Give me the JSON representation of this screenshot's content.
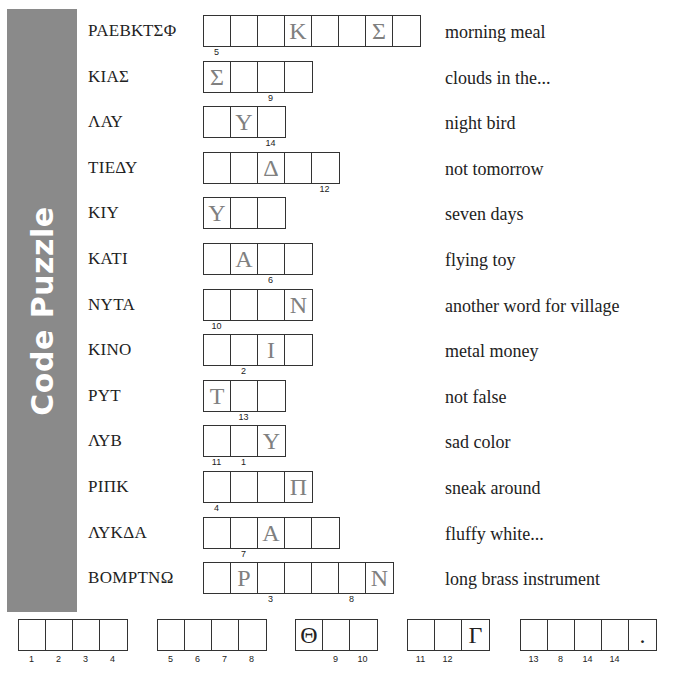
{
  "title": "Code Puzzle",
  "colors": {
    "sidebar": "#8a8a8a",
    "hint_letter": "#808080",
    "text": "#222222"
  },
  "rows": [
    {
      "code": "ΡΑΕΒΚΤΣΦ",
      "cells": [
        "",
        "",
        "",
        "Κ",
        "",
        "",
        "Σ",
        ""
      ],
      "numbers": [
        {
          "pos": 0,
          "n": "5"
        }
      ],
      "clue": "morning meal"
    },
    {
      "code": "ΚΙΑΣ",
      "cells": [
        "Σ",
        "",
        "",
        ""
      ],
      "numbers": [
        {
          "pos": 2,
          "n": "9"
        }
      ],
      "clue": "clouds in the..."
    },
    {
      "code": "ΛΑΥ",
      "cells": [
        "",
        "Υ",
        ""
      ],
      "numbers": [
        {
          "pos": 2,
          "n": "14"
        }
      ],
      "clue": "night bird"
    },
    {
      "code": "ΤΙΕΔΥ",
      "cells": [
        "",
        "",
        "Δ",
        "",
        ""
      ],
      "numbers": [
        {
          "pos": 4,
          "n": "12"
        }
      ],
      "clue": "not tomorrow"
    },
    {
      "code": "ΚΙΥ",
      "cells": [
        "Υ",
        "",
        ""
      ],
      "numbers": [],
      "clue": "seven days"
    },
    {
      "code": "ΚΑΤΙ",
      "cells": [
        "",
        "Α",
        "",
        ""
      ],
      "numbers": [
        {
          "pos": 2,
          "n": "6"
        }
      ],
      "clue": "flying toy"
    },
    {
      "code": "ΝΥΤΑ",
      "cells": [
        "",
        "",
        "",
        "Ν"
      ],
      "numbers": [
        {
          "pos": 0,
          "n": "10"
        }
      ],
      "clue": "another word for village"
    },
    {
      "code": "ΚΙΝΟ",
      "cells": [
        "",
        "",
        "Ι",
        ""
      ],
      "numbers": [
        {
          "pos": 1,
          "n": "2"
        }
      ],
      "clue": "metal money"
    },
    {
      "code": "ΡΥΤ",
      "cells": [
        "Τ",
        "",
        ""
      ],
      "numbers": [
        {
          "pos": 1,
          "n": "13"
        }
      ],
      "clue": "not false"
    },
    {
      "code": "ΛΥΒ",
      "cells": [
        "",
        "",
        "Υ"
      ],
      "numbers": [
        {
          "pos": 0,
          "n": "11"
        },
        {
          "pos": 1,
          "n": "1"
        }
      ],
      "clue": "sad color"
    },
    {
      "code": "ΡΙΠΚ",
      "cells": [
        "",
        "",
        "",
        "Π"
      ],
      "numbers": [
        {
          "pos": 0,
          "n": "4"
        }
      ],
      "clue": "sneak around"
    },
    {
      "code": "ΛΥΚΔΑ",
      "cells": [
        "",
        "",
        "Α",
        "",
        ""
      ],
      "numbers": [
        {
          "pos": 1,
          "n": "7"
        }
      ],
      "clue": "fluffy white..."
    },
    {
      "code": "ΒΟΜΡΤΝΩ",
      "cells": [
        "",
        "Ρ",
        "",
        "",
        "",
        "",
        "Ν"
      ],
      "numbers": [
        {
          "pos": 2,
          "n": "3"
        },
        {
          "pos": 5,
          "n": "8"
        }
      ],
      "clue": "long brass instrument"
    }
  ],
  "answer": [
    {
      "left": 18,
      "cells": [
        "",
        "",
        "",
        ""
      ],
      "numbers": [
        "1",
        "2",
        "3",
        "4"
      ]
    },
    {
      "left": 157,
      "cells": [
        "",
        "",
        "",
        ""
      ],
      "numbers": [
        "5",
        "6",
        "7",
        "8"
      ]
    },
    {
      "left": 295,
      "cells": [
        "Θ",
        "",
        ""
      ],
      "numbers": [
        "",
        "9",
        "10"
      ]
    },
    {
      "left": 407,
      "cells": [
        "",
        "",
        "Γ"
      ],
      "numbers": [
        "11",
        "12",
        ""
      ]
    },
    {
      "left": 520,
      "cells": [
        "",
        "",
        "",
        "",
        "."
      ],
      "numbers": [
        "13",
        "8",
        "14",
        "14",
        ""
      ]
    }
  ]
}
